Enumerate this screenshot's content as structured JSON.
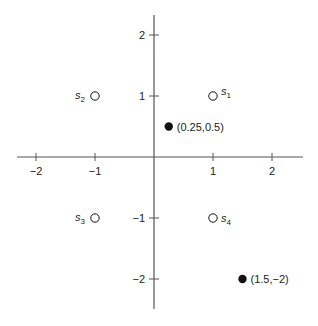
{
  "chart_data": {
    "type": "scatter",
    "title": "",
    "xlabel": "",
    "ylabel": "",
    "xlim": [
      -2.3,
      2.5
    ],
    "ylim": [
      -2.5,
      2.3
    ],
    "grid": false,
    "x_ticks": [
      -2,
      -1,
      1,
      2
    ],
    "y_ticks": [
      2,
      1,
      -1,
      -2
    ],
    "x_tick_labels": [
      "−2",
      "−1",
      "1",
      "2"
    ],
    "y_tick_labels": [
      "2",
      "1",
      "−1",
      "−2"
    ],
    "series": [
      {
        "name": "hollow points",
        "marker": "open-circle",
        "points": [
          {
            "label": "s",
            "sub": "1",
            "x": 1,
            "y": 1
          },
          {
            "label": "s",
            "sub": "2",
            "x": -1,
            "y": 1
          },
          {
            "label": "s",
            "sub": "3",
            "x": -1,
            "y": -1
          },
          {
            "label": "s",
            "sub": "4",
            "x": 1,
            "y": -1
          }
        ]
      },
      {
        "name": "filled points",
        "marker": "filled-circle",
        "points": [
          {
            "label": "(0.25,0.5)",
            "x": 0.25,
            "y": 0.5
          },
          {
            "label": "(1.5,−2)",
            "x": 1.5,
            "y": -2
          }
        ]
      }
    ]
  },
  "colors": {
    "axis": "#555555",
    "marker": "#111111",
    "background": "#ffffff"
  },
  "layout": {
    "origin_px": [
      154,
      157
    ],
    "unit_x_px": 59,
    "unit_y_px": 61,
    "x_axis_px": [
      17,
      303
    ],
    "y_axis_px": [
      15,
      309
    ]
  }
}
